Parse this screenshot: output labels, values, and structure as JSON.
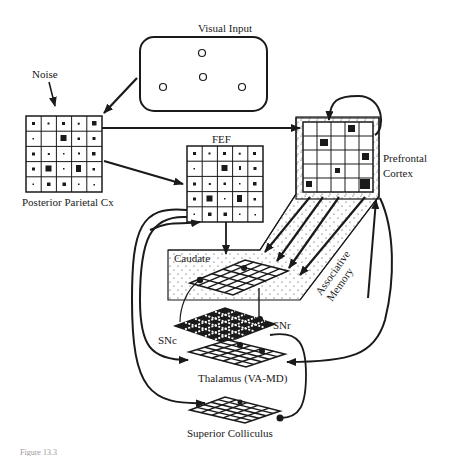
{
  "labels": {
    "visual_input": "Visual Input",
    "noise": "Noise",
    "posterior_parietal": "Posterior Parietal  Cx",
    "fef": "FEF",
    "prefrontal_line1": "Prefrontal",
    "prefrontal_line2": "Cortex",
    "caudate": "Caudate",
    "associative_line1": "Associative",
    "associative_line2": "Memory",
    "snc": "SNc",
    "snr": "SNr",
    "thalamus": "Thalamus (VA-MD)",
    "superior_colliculus": "Superior Colliculus",
    "figure_caption": "Figure 13.3"
  },
  "colors": {
    "ink": "#1a1a1a",
    "background": "#ffffff",
    "caption": "#999999"
  }
}
